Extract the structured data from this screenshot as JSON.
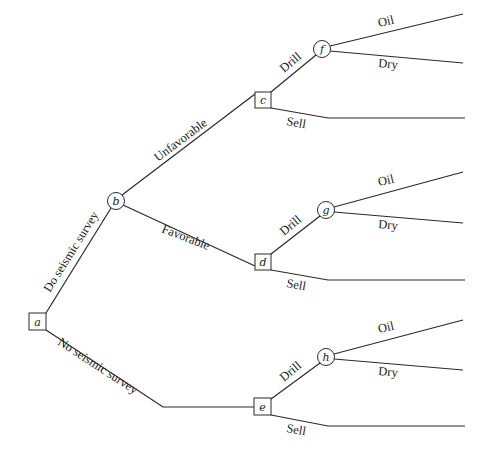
{
  "diagram": {
    "type": "decision-tree",
    "nodes": {
      "a": {
        "label": "a",
        "kind": "decision"
      },
      "b": {
        "label": "b",
        "kind": "chance"
      },
      "c": {
        "label": "c",
        "kind": "decision"
      },
      "d": {
        "label": "d",
        "kind": "decision"
      },
      "e": {
        "label": "e",
        "kind": "decision"
      },
      "f": {
        "label": "f",
        "kind": "chance"
      },
      "g": {
        "label": "g",
        "kind": "chance"
      },
      "h": {
        "label": "h",
        "kind": "chance"
      }
    },
    "edges": {
      "do_survey": "Do seismic survey",
      "no_survey": "No seismic survey",
      "unfavorable": "Unfavorable",
      "favorable": "Favorable",
      "c_drill": "Drill",
      "c_sell": "Sell",
      "d_drill": "Drill",
      "d_sell": "Sell",
      "e_drill": "Drill",
      "e_sell": "Sell",
      "f_oil": "Oil",
      "f_dry": "Dry",
      "g_oil": "Oil",
      "g_dry": "Dry",
      "h_oil": "Oil",
      "h_dry": "Dry"
    }
  }
}
